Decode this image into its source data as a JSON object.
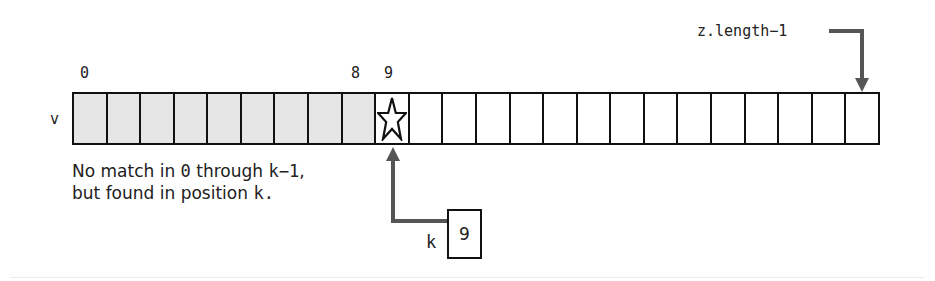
{
  "diagram": {
    "array_name": "v",
    "cell_count": 24,
    "shaded_count": 9,
    "found_index": 9,
    "found_marker": "star-icon",
    "index_labels": [
      {
        "text": "0",
        "cell": 0
      },
      {
        "text": "8",
        "cell": 8
      },
      {
        "text": "9",
        "cell": 9
      }
    ],
    "end_label": "z.length−1",
    "caption": {
      "line1_prefix": "No match in ",
      "line1_code1": "0",
      "line1_mid": " through ",
      "line1_code2": "k−1",
      "line1_suffix": ",",
      "line2_prefix": "but found in position ",
      "line2_code": "k",
      "line2_suffix": "."
    },
    "variable": {
      "name": "k",
      "value": "9"
    },
    "colors": {
      "shaded": "#e6e6e6",
      "arrow": "#555555",
      "border": "#111111"
    }
  }
}
